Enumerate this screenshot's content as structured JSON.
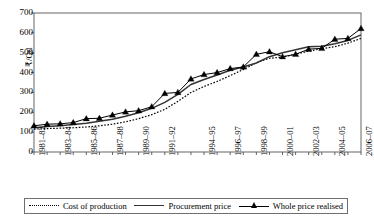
{
  "chart_data": {
    "type": "line",
    "title": "",
    "xlabel": "",
    "ylabel": "₹/Qtl",
    "ylim": [
      0,
      700
    ],
    "yticks": [
      0,
      100,
      200,
      300,
      400,
      500,
      600,
      700
    ],
    "grid": false,
    "legend_position": "bottom",
    "x": [
      "1981–82",
      "1982–83",
      "1983–84",
      "1984–85",
      "1985–86",
      "1986–87",
      "1987–88",
      "1988–89",
      "1989–90",
      "1990–91",
      "1991–92",
      "1992–93",
      "1993–94",
      "1994–95",
      "1995–96",
      "1996–97",
      "1997–98",
      "1998–99",
      "1999–00",
      "2000–01",
      "2001–02",
      "2002–03",
      "2003–04",
      "2004–05",
      "2005–06",
      "2006–07"
    ],
    "xtick_labels": [
      "1981–82",
      "1983–84",
      "1985–86",
      "1987–88",
      "1989–90",
      "1991–92",
      "1994–95",
      "1996–97",
      "1998–99",
      "2000–01",
      "2002–03",
      "2004–05",
      "2006–07"
    ],
    "series": [
      {
        "name": "Cost of production",
        "style": "dotted",
        "marker": "none",
        "color": "#000000",
        "values": [
          115,
          118,
          120,
          122,
          126,
          132,
          140,
          152,
          168,
          188,
          215,
          255,
          300,
          330,
          355,
          385,
          415,
          450,
          472,
          478,
          492,
          508,
          520,
          530,
          548,
          572
        ]
      },
      {
        "name": "Procurement price",
        "style": "solid",
        "marker": "none",
        "color": "#333333",
        "values": [
          122,
          128,
          132,
          138,
          145,
          155,
          165,
          180,
          198,
          220,
          250,
          290,
          340,
          365,
          388,
          412,
          428,
          448,
          480,
          500,
          515,
          530,
          532,
          545,
          562,
          590
        ]
      },
      {
        "name": "Whole price realised",
        "style": "solid",
        "marker": "triangle",
        "color": "#000000",
        "values": [
          132,
          140,
          142,
          148,
          168,
          170,
          186,
          202,
          208,
          228,
          295,
          300,
          368,
          390,
          400,
          420,
          428,
          492,
          505,
          480,
          492,
          518,
          522,
          568,
          572,
          622
        ]
      }
    ]
  },
  "legend": {
    "items": [
      {
        "label": "Cost of production"
      },
      {
        "label": "Procurement price"
      },
      {
        "label": "Whole price realised"
      }
    ]
  },
  "axes": {
    "y_title": "₹/Qtl"
  }
}
